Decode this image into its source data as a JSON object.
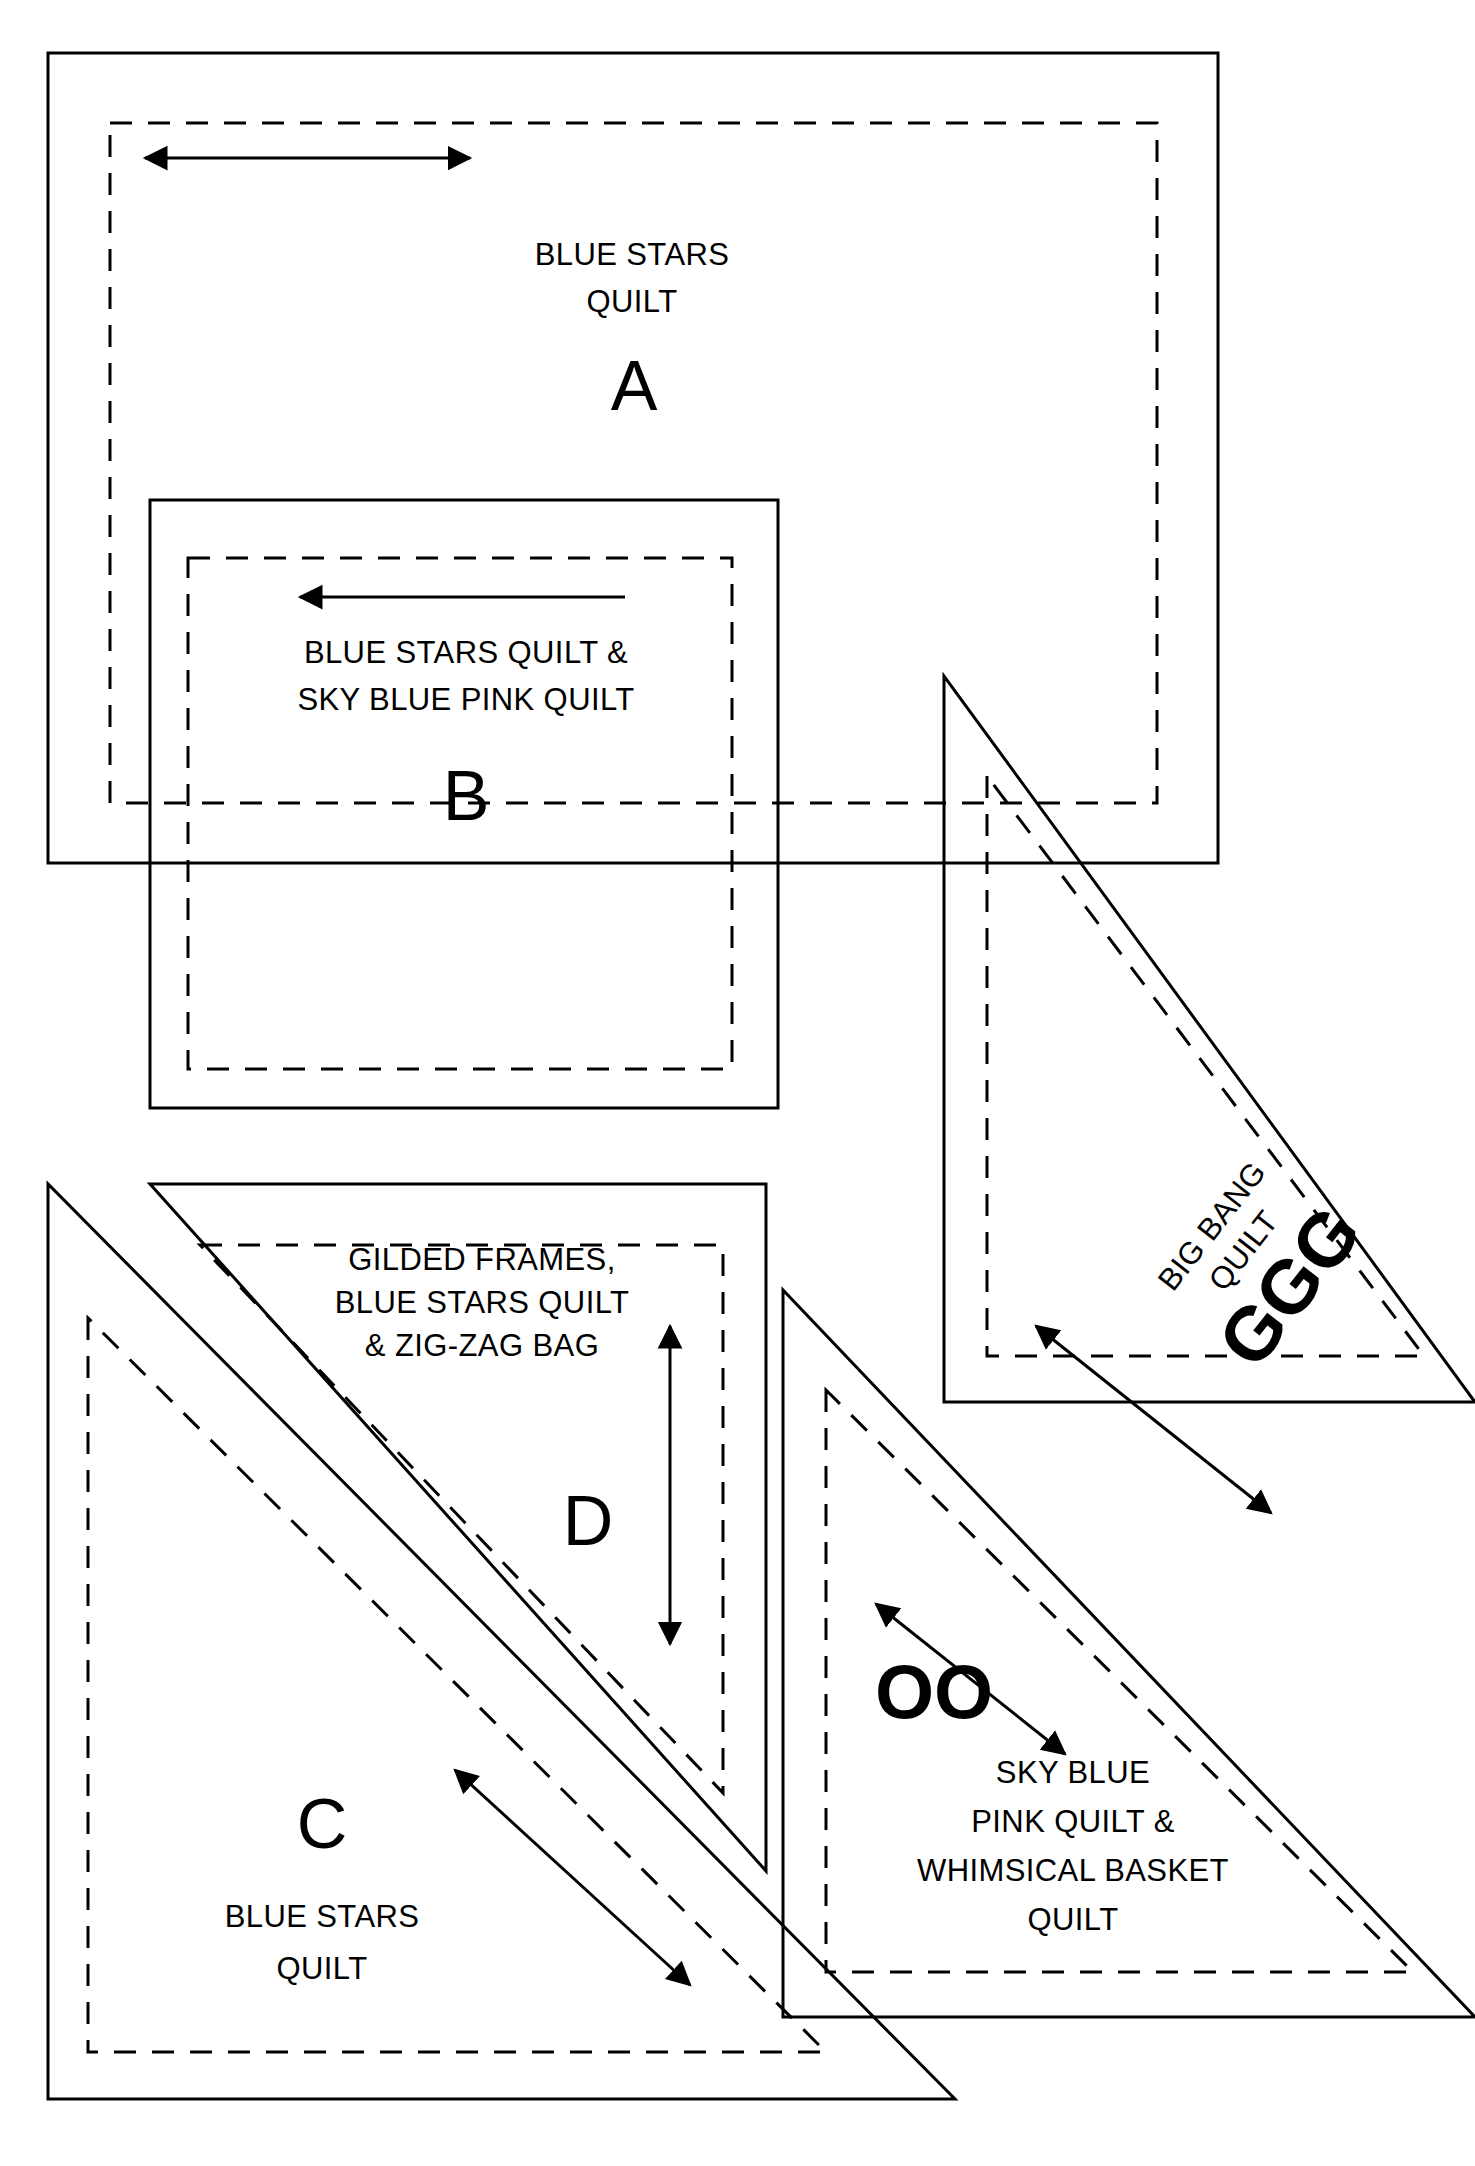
{
  "diagram": {
    "pieces": [
      {
        "id": "A",
        "letter": "A",
        "shape": "square",
        "desc_lines": [
          "BLUE STARS",
          "QUILT"
        ],
        "grain_arrow": "horizontal-double"
      },
      {
        "id": "B",
        "letter": "B",
        "shape": "square",
        "desc_lines": [
          "BLUE STARS QUILT &",
          "SKY BLUE PINK QUILT"
        ],
        "grain_arrow": "horizontal-left"
      },
      {
        "id": "C",
        "letter": "C",
        "shape": "triangle",
        "desc_lines": [
          "BLUE STARS",
          "QUILT"
        ],
        "grain_arrow": "diagonal-double"
      },
      {
        "id": "D",
        "letter": "D",
        "shape": "triangle",
        "desc_lines": [
          "GILDED FRAMES,",
          "BLUE STARS QUILT",
          "& ZIG-ZAG BAG"
        ],
        "grain_arrow": "vertical-double"
      },
      {
        "id": "GGG",
        "letter": "GGG",
        "shape": "triangle",
        "desc_lines": [
          "BIG BANG",
          "QUILT"
        ],
        "grain_arrow": "diagonal-double"
      },
      {
        "id": "OO",
        "letter": "OO",
        "shape": "triangle",
        "desc_lines": [
          "SKY BLUE",
          "PINK QUILT &",
          "WHIMSICAL BASKET",
          "QUILT"
        ],
        "grain_arrow": "diagonal-double"
      }
    ],
    "labels": {
      "a_line1": "BLUE STARS",
      "a_line2": "QUILT",
      "a_letter": "A",
      "b_line1": "BLUE STARS QUILT &",
      "b_line2": "SKY BLUE PINK QUILT",
      "b_letter": "B",
      "c_letter": "C",
      "c_line1": "BLUE STARS",
      "c_line2": "QUILT",
      "d_line1": "GILDED FRAMES,",
      "d_line2": "BLUE STARS QUILT",
      "d_line3": "& ZIG-ZAG BAG",
      "d_letter": "D",
      "ggg_line1": "BIG BANG",
      "ggg_line2": "QUILT",
      "ggg_letter": "GGG",
      "oo_letter": "OO",
      "oo_line1": "SKY BLUE",
      "oo_line2": "PINK QUILT &",
      "oo_line3": "WHIMSICAL BASKET",
      "oo_line4": "QUILT"
    },
    "colors": {
      "ink": "#000000",
      "paper": "#ffffff"
    }
  }
}
